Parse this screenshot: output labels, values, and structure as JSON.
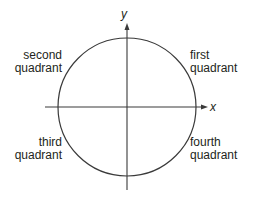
{
  "diagram": {
    "title": "",
    "axes": {
      "x_label": "x",
      "y_label": "y"
    },
    "quadrants": {
      "first": {
        "line1": "first",
        "line2": "quadrant"
      },
      "second": {
        "line1": "second",
        "line2": "quadrant"
      },
      "third": {
        "line1": "third",
        "line2": "quadrant"
      },
      "fourth": {
        "line1": "fourth",
        "line2": "quadrant"
      }
    },
    "colors": {
      "stroke": "#3a3a3a",
      "text": "#231f20",
      "background": "#ffffff"
    }
  }
}
